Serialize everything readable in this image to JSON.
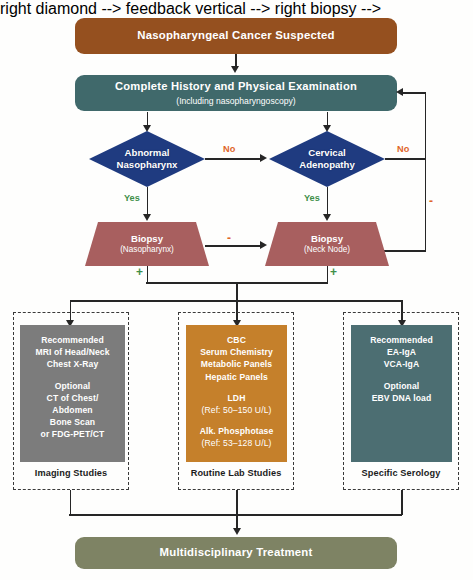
{
  "colors": {
    "suspected_box": "#95501f",
    "history_box": "#40696b",
    "diamond": "#1f3b80",
    "biopsy": "#a85f5f",
    "imaging_panel": "#7c7c7c",
    "lab_panel": "#c5802b",
    "serology_panel": "#4c6e72",
    "treatment_box": "#7e8364",
    "no_label": "#e0662a",
    "yes_label": "#3f8f49",
    "connector": "#262626"
  },
  "nodes": {
    "suspected": {
      "label": "Nasopharyngeal Cancer Suspected"
    },
    "history": {
      "label": "Complete History and Physical Examination",
      "sub": "(Including nasopharyngoscopy)"
    },
    "diamond_nasopharynx": {
      "line1": "Abnormal",
      "line2": "Nasopharynx"
    },
    "diamond_adenopathy": {
      "line1": "Cervical",
      "line2": "Adenopathy"
    },
    "biopsy_nasopharynx": {
      "label": "Biopsy",
      "sub": "(Nasopharynx)"
    },
    "biopsy_necknode": {
      "label": "Biopsy",
      "sub": "(Neck Node)"
    },
    "treatment": {
      "label": "Multidisciplinary Treatment"
    }
  },
  "edge_labels": {
    "no_between_diamonds": "No",
    "no_right_of_adenopathy": "No",
    "yes_left": "Yes",
    "yes_right": "Yes",
    "minus_between_biopsies": "-",
    "minus_feedback": "-",
    "plus_left": "+",
    "plus_right": "+"
  },
  "groups": [
    {
      "group_label": "Imaging Studies",
      "panel_lines": [
        {
          "text": "Recommended",
          "weight": "bold"
        },
        {
          "text": "MRI of Head/Neck",
          "weight": "bold"
        },
        {
          "text": "Chest X-Ray",
          "weight": "bold"
        },
        {
          "text": "",
          "weight": "gap"
        },
        {
          "text": "Optional",
          "weight": "bold"
        },
        {
          "text": "CT of Chest/",
          "weight": "bold"
        },
        {
          "text": "Abdomen",
          "weight": "bold"
        },
        {
          "text": "Bone Scan",
          "weight": "bold"
        },
        {
          "text": "or FDG-PET/CT",
          "weight": "bold"
        }
      ]
    },
    {
      "group_label": "Routine Lab Studies",
      "panel_lines": [
        {
          "text": "CBC",
          "weight": "bold"
        },
        {
          "text": "Serum Chemistry",
          "weight": "bold"
        },
        {
          "text": "Metabolic Panels",
          "weight": "bold"
        },
        {
          "text": "Hepatic Panels",
          "weight": "bold"
        },
        {
          "text": "",
          "weight": "gap"
        },
        {
          "text": "LDH",
          "weight": "bold"
        },
        {
          "text": "(Ref: 50–150 U/L)",
          "weight": "light"
        },
        {
          "text": "",
          "weight": "gap"
        },
        {
          "text": "Alk. Phosphotase",
          "weight": "bold"
        },
        {
          "text": "(Ref: 53–128 U/L)",
          "weight": "light"
        }
      ]
    },
    {
      "group_label": "Specific Serology",
      "panel_lines": [
        {
          "text": "Recommended",
          "weight": "bold"
        },
        {
          "text": "EA-IgA",
          "weight": "bold"
        },
        {
          "text": "VCA-IgA",
          "weight": "bold"
        },
        {
          "text": "",
          "weight": "gap"
        },
        {
          "text": "Optional",
          "weight": "bold"
        },
        {
          "text": "EBV DNA load",
          "weight": "bold"
        }
      ]
    }
  ]
}
